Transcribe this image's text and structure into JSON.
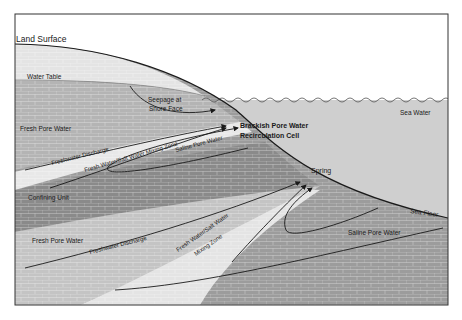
{
  "diagram": {
    "type": "cross-section",
    "colors": {
      "sky": "#ffffff",
      "unsaturated": "#e4e4e4",
      "fresh_pore_water": "#b4b4b4",
      "mixing_zone": "#e8e8e8",
      "saline_pore_water": "#9c9c9c",
      "confining_unit": "#8a8a8a",
      "sea_water": "#cfcfcf",
      "lines": "#1a1a1a"
    },
    "labels": {
      "land_surface": "Land Surface",
      "water_table": "Water Table",
      "seepage": [
        "Seepage at",
        "Shore Face"
      ],
      "fresh_pore_water_upper": "Fresh Pore Water",
      "freshwater_discharge_upper": "Freshwater Discharge",
      "mixing_zone_upper": "Fresh Water/Salt Water Mixing Zone",
      "saline_pore_water_upper": "Saline Pore Water",
      "brackish_cell": [
        "Brackish Pore Water",
        "Recirculation Cell"
      ],
      "sea_water": "Sea Water",
      "confining_unit": "Confining Unit",
      "spring": "Spring",
      "sea_floor": "Sea Floor",
      "fresh_pore_water_lower": "Fresh Pore Water",
      "freshwater_discharge_lower": "Freshwater Discharge",
      "mixing_zone_lower": [
        "Fresh Water/Salt Water",
        "Mixing Zone"
      ],
      "saline_pore_water_lower": "Saline Pore Water"
    }
  }
}
